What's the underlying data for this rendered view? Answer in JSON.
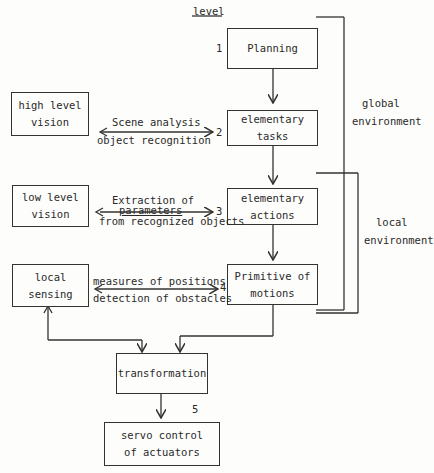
{
  "header": {
    "level_label": "level"
  },
  "levels": [
    {
      "number": "1",
      "box": [
        "Planning"
      ]
    },
    {
      "number": "2",
      "box": [
        "elementary",
        "tasks"
      ]
    },
    {
      "number": "3",
      "box": [
        "elementary",
        "actions"
      ]
    },
    {
      "number": "4",
      "box": [
        "Primitive of",
        "motions"
      ]
    },
    {
      "number": "5"
    }
  ],
  "side_boxes": {
    "high_level_vision": [
      "high level",
      "vision"
    ],
    "low_level_vision": [
      "low level",
      "vision"
    ],
    "local_sensing": [
      "local",
      "sensing"
    ]
  },
  "links": {
    "level2": [
      "Scene analysis",
      "object recognition"
    ],
    "level3": [
      "Extraction of",
      "parameters",
      "from recognized objects"
    ],
    "level4": [
      "measures of positions",
      "detection of obstacles"
    ]
  },
  "bottom_boxes": {
    "transformation": [
      "transformation"
    ],
    "servo": [
      "servo control",
      "of actuators"
    ]
  },
  "brackets": {
    "global": [
      "global",
      "environment"
    ],
    "local": [
      "local",
      "environment"
    ]
  }
}
